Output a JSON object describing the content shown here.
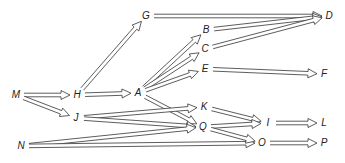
{
  "diagram": {
    "type": "activity network (arrow diagram)",
    "nodes": [
      {
        "id": "M",
        "label": "M",
        "x": 16,
        "y": 95
      },
      {
        "id": "H",
        "label": "H",
        "x": 77,
        "y": 95
      },
      {
        "id": "J",
        "label": "J",
        "x": 76,
        "y": 118
      },
      {
        "id": "N",
        "label": "N",
        "x": 21,
        "y": 146
      },
      {
        "id": "G",
        "label": "G",
        "x": 146,
        "y": 16
      },
      {
        "id": "A",
        "label": "A",
        "x": 138,
        "y": 93
      },
      {
        "id": "B",
        "label": "B",
        "x": 206,
        "y": 30
      },
      {
        "id": "C",
        "label": "C",
        "x": 205,
        "y": 49
      },
      {
        "id": "E",
        "label": "E",
        "x": 205,
        "y": 69
      },
      {
        "id": "K",
        "label": "K",
        "x": 204,
        "y": 107
      },
      {
        "id": "Q",
        "label": "Q",
        "x": 203,
        "y": 127
      },
      {
        "id": "D",
        "label": "D",
        "x": 329,
        "y": 16
      },
      {
        "id": "F",
        "label": "F",
        "x": 324,
        "y": 74
      },
      {
        "id": "I",
        "label": "I",
        "x": 268,
        "y": 123
      },
      {
        "id": "L",
        "label": "L",
        "x": 324,
        "y": 123
      },
      {
        "id": "O",
        "label": "O",
        "x": 262,
        "y": 143
      },
      {
        "id": "P",
        "label": "P",
        "x": 324,
        "y": 143
      }
    ],
    "edges": [
      [
        "M",
        "H"
      ],
      [
        "M",
        "J"
      ],
      [
        "H",
        "G"
      ],
      [
        "H",
        "A"
      ],
      [
        "A",
        "B"
      ],
      [
        "A",
        "C"
      ],
      [
        "A",
        "E"
      ],
      [
        "A",
        "Q"
      ],
      [
        "J",
        "K"
      ],
      [
        "J",
        "Q"
      ],
      [
        "N",
        "Q"
      ],
      [
        "N",
        "O"
      ],
      [
        "G",
        "D"
      ],
      [
        "B",
        "D"
      ],
      [
        "C",
        "D"
      ],
      [
        "E",
        "F"
      ],
      [
        "K",
        "I"
      ],
      [
        "Q",
        "I"
      ],
      [
        "Q",
        "O"
      ],
      [
        "I",
        "L"
      ],
      [
        "O",
        "P"
      ]
    ]
  }
}
